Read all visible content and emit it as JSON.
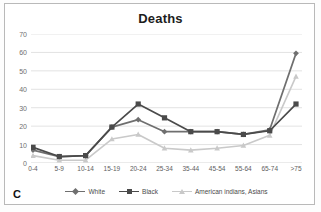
{
  "figure": {
    "panel_letter": "C",
    "title": "Deaths"
  },
  "legend": {
    "position": "bottom",
    "items": [
      {
        "label": "White",
        "color": "#6f6f6f",
        "marker": "diamond"
      },
      {
        "label": "Black",
        "color": "#4a4a4a",
        "marker": "square"
      },
      {
        "label": "American indians, Asians",
        "color": "#c9c9c9",
        "marker": "triangle"
      }
    ]
  },
  "axes": {
    "y_ticks": [
      "0",
      "10",
      "20",
      "30",
      "40",
      "50",
      "60",
      "70"
    ],
    "x_ticks": [
      "0-4",
      "5-9",
      "10-14",
      "15-19",
      "20-24",
      "25-34",
      "35-44",
      "45-54",
      "55-64",
      "65-74",
      ">75"
    ]
  },
  "chart_data": {
    "type": "line",
    "title": "Deaths",
    "xlabel": "",
    "ylabel": "",
    "ylim": [
      0,
      70
    ],
    "ytick_step": 10,
    "grid": true,
    "legend_position": "bottom",
    "categories": [
      "0-4",
      "5-9",
      "10-14",
      "15-19",
      "20-24",
      "25-34",
      "35-44",
      "45-54",
      "55-64",
      "65-74",
      ">75"
    ],
    "series": [
      {
        "name": "White",
        "color": "#6f6f6f",
        "marker": "diamond",
        "values": [
          7,
          3.5,
          4,
          19.5,
          23.5,
          17,
          17,
          17,
          15.5,
          18,
          59.5
        ]
      },
      {
        "name": "Black",
        "color": "#4a4a4a",
        "marker": "square",
        "values": [
          8.5,
          3.5,
          4,
          19.5,
          32,
          24.5,
          17,
          17,
          15.5,
          17.5,
          32
        ]
      },
      {
        "name": "American indians, Asians",
        "color": "#c9c9c9",
        "marker": "triangle",
        "values": [
          4,
          1.5,
          1.5,
          13,
          15.5,
          8,
          7,
          8,
          9.5,
          15,
          47
        ]
      }
    ]
  }
}
